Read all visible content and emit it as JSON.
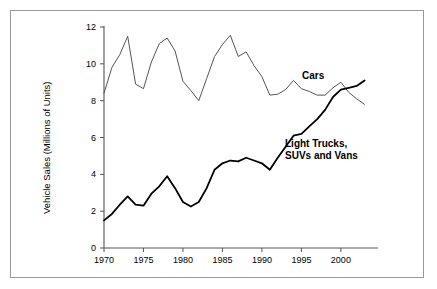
{
  "figure": {
    "background_color": "#ffffff",
    "frame_color": "#9a9a9a",
    "axis_color": "#555555"
  },
  "chart_data": {
    "type": "line",
    "title": "",
    "xlabel": "",
    "ylabel": "Vehicle Sales (Millions of Units)",
    "xlim": [
      1970,
      2004.7
    ],
    "ylim": [
      0,
      12
    ],
    "xticks": [
      1970,
      1975,
      1980,
      1985,
      1990,
      1995,
      2000
    ],
    "xtick_labels": [
      "1970",
      "1975",
      "1980",
      "1985",
      "1990",
      "1995",
      "2000"
    ],
    "yticks": [
      0,
      2,
      4,
      6,
      8,
      10,
      12
    ],
    "ytick_labels": [
      "0",
      "2",
      "4",
      "6",
      "8",
      "10",
      "12"
    ],
    "grid": false,
    "legend_position": "inline-annotations",
    "x": [
      1970,
      1971,
      1972,
      1973,
      1974,
      1975,
      1976,
      1977,
      1978,
      1979,
      1980,
      1981,
      1982,
      1983,
      1984,
      1985,
      1986,
      1987,
      1988,
      1989,
      1990,
      1991,
      1992,
      1993,
      1994,
      1995,
      1996,
      1997,
      1998,
      1999,
      2000,
      2001,
      2002,
      2003
    ],
    "series": [
      {
        "name": "Cars",
        "color": "#555555",
        "line_width": 1,
        "label_text": "Cars",
        "values": [
          8.4,
          9.8,
          10.5,
          11.5,
          8.9,
          8.65,
          10.1,
          11.1,
          11.4,
          10.7,
          9.05,
          8.55,
          8.0,
          9.2,
          10.4,
          11.05,
          11.55,
          10.4,
          10.65,
          9.9,
          9.3,
          8.3,
          8.35,
          8.6,
          9.1,
          8.65,
          8.5,
          8.3,
          8.3,
          8.7,
          9.0,
          8.45,
          8.1,
          7.8
        ]
      },
      {
        "name": "Light Trucks, SUVs and Vans",
        "color": "#000000",
        "line_width": 1.8,
        "label_text_line1": "Light Trucks,",
        "label_text_line2": "SUVs and Vans",
        "values": [
          1.5,
          1.85,
          2.35,
          2.8,
          2.35,
          2.3,
          2.95,
          3.35,
          3.9,
          3.25,
          2.5,
          2.25,
          2.5,
          3.25,
          4.25,
          4.6,
          4.75,
          4.7,
          4.9,
          4.75,
          4.6,
          4.25,
          4.9,
          5.5,
          6.1,
          6.2,
          6.6,
          7.0,
          7.5,
          8.2,
          8.6,
          8.7,
          8.8,
          9.1
        ]
      }
    ],
    "annotations": [
      {
        "text": "Cars",
        "x_px": 302,
        "y_px": 70
      },
      {
        "text": "Light Trucks,",
        "x_px": 285,
        "y_px": 138
      },
      {
        "text": "SUVs and Vans",
        "x_px": 285,
        "y_px": 150
      }
    ]
  }
}
